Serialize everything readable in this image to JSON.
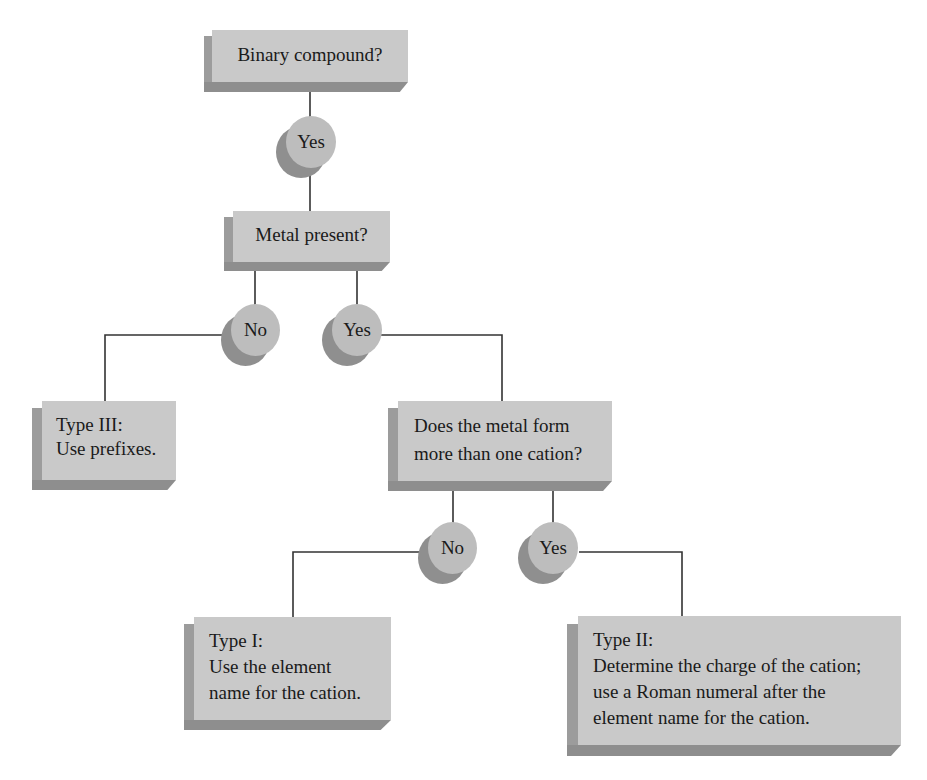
{
  "diagram": {
    "colors": {
      "box_face": "#c9c9c9",
      "box_shadow": "#9c9c9c",
      "circle_face": "#bdbdbd",
      "circle_shadow": "#8f8f8f",
      "line": "#333333"
    },
    "nodes": {
      "binary": {
        "label": "Binary compound?"
      },
      "yes1": {
        "label": "Yes"
      },
      "metal": {
        "label": "Metal present?"
      },
      "no2": {
        "label": "No"
      },
      "yes2": {
        "label": "Yes"
      },
      "type3": {
        "line1": "Type III:",
        "line2": "Use prefixes."
      },
      "multi": {
        "line1": "Does the metal form",
        "line2": "more than one cation?"
      },
      "no3": {
        "label": "No"
      },
      "yes3": {
        "label": "Yes"
      },
      "type1": {
        "line1": "Type I:",
        "line2": "Use the element",
        "line3": "name for the cation."
      },
      "type2": {
        "line1": "Type II:",
        "line2": "Determine the charge of the cation;",
        "line3": "use a Roman numeral after the",
        "line4": "element name for the cation."
      }
    },
    "edges": [
      {
        "from": "binary",
        "to": "yes1"
      },
      {
        "from": "yes1",
        "to": "metal"
      },
      {
        "from": "metal",
        "to": "no2"
      },
      {
        "from": "metal",
        "to": "yes2"
      },
      {
        "from": "no2",
        "to": "type3"
      },
      {
        "from": "yes2",
        "to": "multi"
      },
      {
        "from": "multi",
        "to": "no3"
      },
      {
        "from": "multi",
        "to": "yes3"
      },
      {
        "from": "no3",
        "to": "type1"
      },
      {
        "from": "yes3",
        "to": "type2"
      }
    ]
  }
}
